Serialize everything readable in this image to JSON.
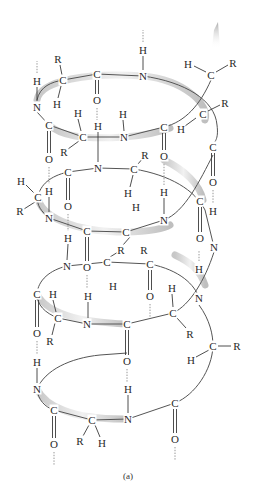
{
  "figure": {
    "caption": "(a)",
    "colors": {
      "text": "#2a2a2a",
      "bond": "#3a3a3a",
      "ribbon_shadow": "#b0b0b0",
      "hbond": "#8a8a8a",
      "background": "#ffffff"
    }
  },
  "atoms": [
    {
      "label": "H",
      "x": 143,
      "y": 50
    },
    {
      "label": "N",
      "x": 143,
      "y": 76
    },
    {
      "label": "H",
      "x": 37,
      "y": 81
    },
    {
      "label": "C",
      "x": 63,
      "y": 80
    },
    {
      "label": "R",
      "x": 58,
      "y": 59
    },
    {
      "label": "H",
      "x": 57,
      "y": 104
    },
    {
      "label": "C",
      "x": 97,
      "y": 74
    },
    {
      "label": "O",
      "x": 97,
      "y": 100
    },
    {
      "label": "N",
      "x": 37,
      "y": 107
    },
    {
      "label": "H",
      "x": 188,
      "y": 64
    },
    {
      "label": "C",
      "x": 211,
      "y": 75
    },
    {
      "label": "R",
      "x": 233,
      "y": 63
    },
    {
      "label": "C",
      "x": 203,
      "y": 114
    },
    {
      "label": "R",
      "x": 225,
      "y": 103
    },
    {
      "label": "H",
      "x": 181,
      "y": 129
    },
    {
      "label": "H",
      "x": 78,
      "y": 113
    },
    {
      "label": "H",
      "x": 98,
      "y": 126
    },
    {
      "label": "H",
      "x": 123,
      "y": 114
    },
    {
      "label": "C",
      "x": 49,
      "y": 125
    },
    {
      "label": "C",
      "x": 83,
      "y": 137
    },
    {
      "label": "N",
      "x": 124,
      "y": 137
    },
    {
      "label": "C",
      "x": 164,
      "y": 127
    },
    {
      "label": "R",
      "x": 64,
      "y": 152
    },
    {
      "label": "O",
      "x": 49,
      "y": 159
    },
    {
      "label": "C",
      "x": 213,
      "y": 147
    },
    {
      "label": "R",
      "x": 145,
      "y": 155
    },
    {
      "label": "O",
      "x": 164,
      "y": 156
    },
    {
      "label": "N",
      "x": 98,
      "y": 168
    },
    {
      "label": "C",
      "x": 68,
      "y": 172
    },
    {
      "label": "C",
      "x": 134,
      "y": 169
    },
    {
      "label": "H",
      "x": 21,
      "y": 181
    },
    {
      "label": "H",
      "x": 49,
      "y": 191
    },
    {
      "label": "C",
      "x": 38,
      "y": 197
    },
    {
      "label": "H",
      "x": 128,
      "y": 193
    },
    {
      "label": "H",
      "x": 164,
      "y": 192
    },
    {
      "label": "O",
      "x": 213,
      "y": 182
    },
    {
      "label": "O",
      "x": 68,
      "y": 206
    },
    {
      "label": "R",
      "x": 20,
      "y": 211
    },
    {
      "label": "C",
      "x": 200,
      "y": 201
    },
    {
      "label": "H",
      "x": 213,
      "y": 211
    },
    {
      "label": "N",
      "x": 49,
      "y": 218
    },
    {
      "label": "H",
      "x": 136,
      "y": 207
    },
    {
      "label": "N",
      "x": 164,
      "y": 220
    },
    {
      "label": "H",
      "x": 68,
      "y": 238
    },
    {
      "label": "C",
      "x": 87,
      "y": 231
    },
    {
      "label": "C",
      "x": 126,
      "y": 232
    },
    {
      "label": "O",
      "x": 200,
      "y": 238
    },
    {
      "label": "R",
      "x": 121,
      "y": 250
    },
    {
      "label": "R",
      "x": 144,
      "y": 250
    },
    {
      "label": "N",
      "x": 214,
      "y": 247
    },
    {
      "label": "N",
      "x": 67,
      "y": 266
    },
    {
      "label": "O",
      "x": 87,
      "y": 267
    },
    {
      "label": "C",
      "x": 107,
      "y": 262
    },
    {
      "label": "C",
      "x": 150,
      "y": 264
    },
    {
      "label": "H",
      "x": 199,
      "y": 269
    },
    {
      "label": "H",
      "x": 113,
      "y": 286
    },
    {
      "label": "H",
      "x": 172,
      "y": 288
    },
    {
      "label": "O",
      "x": 150,
      "y": 296
    },
    {
      "label": "C",
      "x": 37,
      "y": 294
    },
    {
      "label": "H",
      "x": 53,
      "y": 294
    },
    {
      "label": "N",
      "x": 199,
      "y": 298
    },
    {
      "label": "H",
      "x": 88,
      "y": 296
    },
    {
      "label": "C",
      "x": 58,
      "y": 318
    },
    {
      "label": "N",
      "x": 87,
      "y": 324
    },
    {
      "label": "C",
      "x": 127,
      "y": 324
    },
    {
      "label": "C",
      "x": 173,
      "y": 313
    },
    {
      "label": "O",
      "x": 37,
      "y": 333
    },
    {
      "label": "R",
      "x": 50,
      "y": 341
    },
    {
      "label": "R",
      "x": 190,
      "y": 334
    },
    {
      "label": "C",
      "x": 213,
      "y": 346
    },
    {
      "label": "R",
      "x": 237,
      "y": 346
    },
    {
      "label": "H",
      "x": 191,
      "y": 360
    },
    {
      "label": "H",
      "x": 37,
      "y": 362
    },
    {
      "label": "O",
      "x": 127,
      "y": 361
    },
    {
      "label": "N",
      "x": 37,
      "y": 389
    },
    {
      "label": "H",
      "x": 128,
      "y": 389
    },
    {
      "label": "C",
      "x": 54,
      "y": 410
    },
    {
      "label": "C",
      "x": 92,
      "y": 420
    },
    {
      "label": "N",
      "x": 128,
      "y": 419
    },
    {
      "label": "C",
      "x": 175,
      "y": 403
    },
    {
      "label": "R",
      "x": 80,
      "y": 441
    },
    {
      "label": "H",
      "x": 102,
      "y": 443
    },
    {
      "label": "O",
      "x": 54,
      "y": 444
    },
    {
      "label": "O",
      "x": 175,
      "y": 439
    }
  ],
  "hbonds": [
    {
      "x1": 143,
      "y1": 42,
      "x2": 143,
      "y2": 30
    },
    {
      "x1": 37,
      "y1": 73,
      "x2": 37,
      "y2": 61
    },
    {
      "x1": 97,
      "y1": 108,
      "x2": 97,
      "y2": 120
    },
    {
      "x1": 49,
      "y1": 167,
      "x2": 49,
      "y2": 184
    },
    {
      "x1": 164,
      "y1": 164,
      "x2": 164,
      "y2": 185
    },
    {
      "x1": 213,
      "y1": 190,
      "x2": 213,
      "y2": 204
    },
    {
      "x1": 68,
      "y1": 214,
      "x2": 68,
      "y2": 231
    },
    {
      "x1": 87,
      "y1": 275,
      "x2": 87,
      "y2": 289
    },
    {
      "x1": 199,
      "y1": 261,
      "x2": 199,
      "y2": 250
    },
    {
      "x1": 150,
      "y1": 304,
      "x2": 150,
      "y2": 318
    },
    {
      "x1": 37,
      "y1": 341,
      "x2": 37,
      "y2": 355
    },
    {
      "x1": 127,
      "y1": 369,
      "x2": 127,
      "y2": 382
    },
    {
      "x1": 54,
      "y1": 452,
      "x2": 54,
      "y2": 466
    },
    {
      "x1": 175,
      "y1": 447,
      "x2": 175,
      "y2": 461
    }
  ]
}
